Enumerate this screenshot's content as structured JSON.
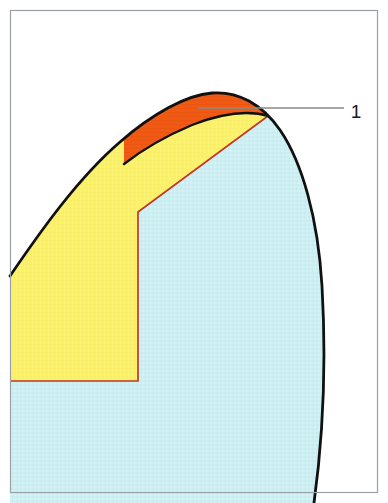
{
  "figure": {
    "width": 388,
    "height": 503,
    "background_color": "#FFFFFF",
    "frame": {
      "stroke_color": "#9AA0A6",
      "stroke_width": 1.2,
      "x": 10,
      "y": 10,
      "width": 368,
      "height": 483
    },
    "regions": [
      {
        "id": "region-orange",
        "name": "orange-apex-layer",
        "fill_color": "#F05A14",
        "stroke_color": "#111111",
        "stroke_width": 2.6,
        "description": "Narrow crescent/lens shaped layer at the apex"
      },
      {
        "id": "region-yellow",
        "name": "yellow-middle-layer",
        "fill_color": "#FAF06A",
        "stroke_color": "#C0392B",
        "stroke_width": 1.6,
        "description": "Broad yellow layer along the left flank"
      },
      {
        "id": "region-blue",
        "name": "blue-core-layer",
        "fill_color": "#CDEFF2",
        "stroke_color": "#C0392B",
        "stroke_width": 1.6,
        "description": "Pale blue core occupying the right and lower body"
      }
    ],
    "outline": {
      "id": "outer-contour",
      "name": "outer-contour",
      "stroke_color": "#111111",
      "stroke_width": 2.8
    },
    "internal_boundary": {
      "id": "internal-boundary",
      "name": "internal-boundary",
      "stroke_color": "#C0392B",
      "stroke_width": 1.7
    },
    "callouts": [
      {
        "id": "callout-1",
        "name": "callout-label-1",
        "label": "1",
        "label_x": 356,
        "label_y": 118,
        "leader_color": "#8A8A8A",
        "leader_width": 1.3,
        "leader_from_x": 198,
        "leader_from_y": 108,
        "leader_to_x": 344,
        "leader_to_y": 108,
        "points_to_region": "region-orange"
      }
    ]
  }
}
